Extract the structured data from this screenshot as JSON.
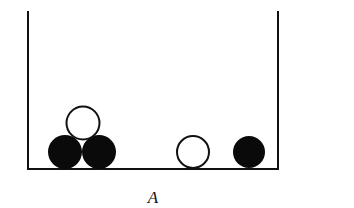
{
  "diagram": {
    "label": "A",
    "container": {
      "left": 28,
      "right": 278,
      "top": 11,
      "bottom": 169
    },
    "colors": {
      "stroke": "#111111",
      "black_ball": "#0a0a0a",
      "white_ball": "#ffffff"
    },
    "balls": [
      {
        "color": "black",
        "cx": 65,
        "cy": 152,
        "r": 17
      },
      {
        "color": "black",
        "cx": 99,
        "cy": 152,
        "r": 17
      },
      {
        "color": "white",
        "cx": 83,
        "cy": 123,
        "r": 17
      },
      {
        "color": "white",
        "cx": 193,
        "cy": 152,
        "r": 16
      },
      {
        "color": "black",
        "cx": 249,
        "cy": 152,
        "r": 16
      }
    ]
  }
}
